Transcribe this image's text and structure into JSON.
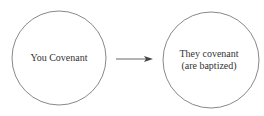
{
  "diagram": {
    "type": "flow",
    "nodes": [
      {
        "id": "you",
        "lines": [
          "You Covenant"
        ]
      },
      {
        "id": "they",
        "lines": [
          "They covenant",
          "(are baptized)"
        ]
      }
    ],
    "edges": [
      {
        "from": "you",
        "to": "they",
        "style": "arrow"
      }
    ],
    "colors": {
      "stroke": "#7a7a7a",
      "arrow": "#444444",
      "text": "#333333",
      "background": "#ffffff"
    }
  }
}
